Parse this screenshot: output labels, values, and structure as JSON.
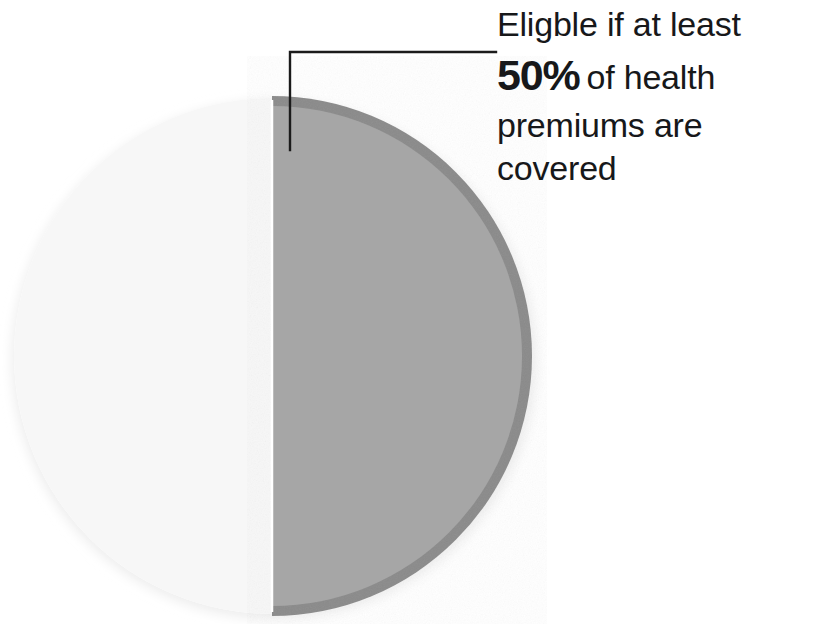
{
  "page": {
    "background_color": "#ffffff",
    "width": 819,
    "height": 624
  },
  "annotation": {
    "name": "eligibility-callout",
    "line1": "Eligble if at least",
    "percent": "50%",
    "line2_rest": "of health",
    "line3": "premiums are",
    "line4": "covered",
    "full_text": "Eligble if at least 50% of health premiums are covered",
    "text_color": "#17181a",
    "leader_line_color": "#1b1b1b"
  },
  "chart_data": {
    "type": "pie",
    "title": "",
    "subtitle": "",
    "xlabel": "",
    "ylabel": "",
    "grid": false,
    "legend_position": "none",
    "labels": [
      "Covered",
      "Not covered"
    ],
    "values": [
      50,
      50
    ],
    "unit": "%",
    "start_angle_deg": 0,
    "direction": "clockwise",
    "annotations": [
      {
        "target_slice": "Covered",
        "text": "Eligble if at least 50% of health premiums are covered"
      }
    ],
    "slices": [
      {
        "label": "Covered",
        "value": 50,
        "display_value": "50%",
        "fill_color": "#a6a6a6",
        "rim_color": "#8a8a8a",
        "position": "right-half",
        "callout": true
      },
      {
        "label": "Not covered",
        "value": 50,
        "display_value": "50%",
        "fill_color": "#f7f7f7",
        "rim_color": "#f2f2f2",
        "position": "left-half",
        "callout": false
      }
    ]
  },
  "colors": {
    "slice_covered": "#a6a6a6",
    "slice_uncovered": "#f7f7f7",
    "slice_rim_dark": "#8a8a8a",
    "text": "#17181a",
    "leader": "#1b1b1b",
    "shadow": "#efefef"
  }
}
